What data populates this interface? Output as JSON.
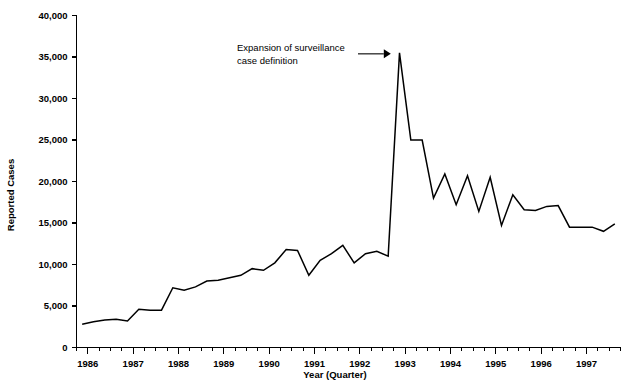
{
  "chart_data": {
    "type": "line",
    "title": "",
    "xlabel": "Year (Quarter)",
    "ylabel": "Reported Cases",
    "ylim": [
      0,
      40000
    ],
    "xlim": [
      1985.75,
      1997.75
    ],
    "grid": false,
    "legend": null,
    "y_ticks": [
      0,
      5000,
      10000,
      15000,
      20000,
      25000,
      30000,
      35000,
      40000
    ],
    "y_tick_labels": [
      "0",
      "5,000",
      "10,000",
      "15,000",
      "20,000",
      "25,000",
      "30,000",
      "35,000",
      "40,000"
    ],
    "x_ticks": [
      1986,
      1987,
      1988,
      1989,
      1990,
      1991,
      1992,
      1993,
      1994,
      1995,
      1996,
      1997
    ],
    "x_tick_labels": [
      "1986",
      "1987",
      "1988",
      "1989",
      "1990",
      "1991",
      "1992",
      "1993",
      "1994",
      "1995",
      "1996",
      "1997"
    ],
    "x_minor_interval": 0.25,
    "annotations": [
      {
        "text_line_1": "Expansion of surveillance",
        "text_line_2": "case definition",
        "points_to_x": 1992.75,
        "points_to_y": 35500,
        "arrow": "right"
      }
    ],
    "series": [
      {
        "name": "Reported Cases",
        "color": "#000000",
        "x": [
          1985.875,
          1986.125,
          1986.375,
          1986.625,
          1986.875,
          1987.125,
          1987.375,
          1987.625,
          1987.875,
          1988.125,
          1988.375,
          1988.625,
          1988.875,
          1989.125,
          1989.375,
          1989.625,
          1989.875,
          1990.125,
          1990.375,
          1990.625,
          1990.875,
          1991.125,
          1991.375,
          1991.625,
          1991.875,
          1992.125,
          1992.375,
          1992.625,
          1992.875,
          1993.125,
          1993.375,
          1993.625,
          1993.875,
          1994.125,
          1994.375,
          1994.625,
          1994.875,
          1995.125,
          1995.375,
          1995.625,
          1995.875,
          1996.125,
          1996.375,
          1996.625,
          1996.875,
          1997.125,
          1997.375,
          1997.625
        ],
        "y": [
          2800,
          3100,
          3300,
          3400,
          3200,
          4600,
          4500,
          4500,
          7200,
          6900,
          7300,
          8000,
          8100,
          8400,
          8700,
          9500,
          9300,
          10200,
          11800,
          11700,
          8700,
          10500,
          11300,
          12300,
          10200,
          11300,
          11600,
          11000,
          35500,
          25000,
          25000,
          18000,
          20900,
          17200,
          20700,
          16400,
          20500,
          14700,
          18400,
          16600,
          16500,
          17000,
          17100,
          14500,
          14500,
          14500,
          14000,
          14900
        ]
      }
    ]
  }
}
